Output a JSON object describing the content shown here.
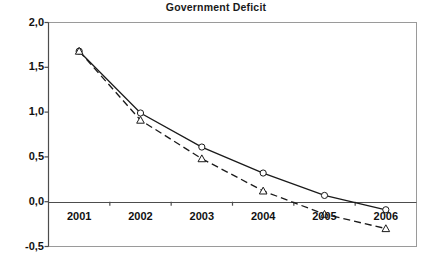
{
  "chart_data": {
    "type": "line",
    "title": "Government Deficit",
    "xlabel": "",
    "ylabel": "",
    "categories": [
      "2001",
      "2002",
      "2003",
      "2004",
      "2005",
      "2006"
    ],
    "x_tick_labels": [
      "2001",
      "2002",
      "2003",
      "2004",
      "2005",
      "2006"
    ],
    "y_tick_labels": [
      "2,0",
      "1,5",
      "1,0",
      "0,5",
      "0,0",
      "-0,5"
    ],
    "y_tick_values": [
      2.0,
      1.5,
      1.0,
      0.5,
      0.0,
      -0.5
    ],
    "ylim": [
      -0.5,
      2.0
    ],
    "grid": false,
    "legend": "none",
    "zero_line": 0.0,
    "decimal_separator": ",",
    "series": [
      {
        "name": "series-1",
        "style": "solid",
        "marker": "circle",
        "color": "#1a1a1a",
        "values": [
          1.68,
          0.99,
          0.61,
          0.32,
          0.07,
          -0.09
        ]
      },
      {
        "name": "series-2",
        "style": "dashed",
        "marker": "triangle",
        "color": "#1a1a1a",
        "values": [
          1.68,
          0.91,
          0.48,
          0.12,
          -0.14,
          -0.3
        ]
      }
    ],
    "colors": {
      "background": "#ffffff",
      "plot_border": "#9a9a9a",
      "axis": "#555555",
      "text": "#111111",
      "line": "#1a1a1a"
    }
  }
}
